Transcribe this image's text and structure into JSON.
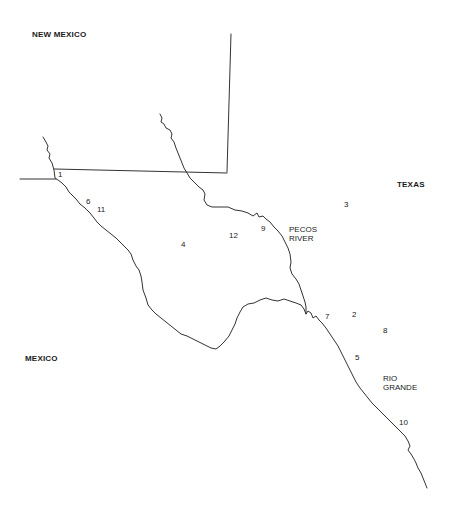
{
  "map": {
    "regions": {
      "new_mexico": "NEW MEXICO",
      "texas": "TEXAS",
      "mexico": "MEXICO"
    },
    "rivers": {
      "pecos": {
        "line1": "PECOS",
        "line2": "RIVER"
      },
      "rio_grande": {
        "line1": "RIO",
        "line2": "GRANDE"
      }
    },
    "sites": [
      {
        "id": "1",
        "label": "1"
      },
      {
        "id": "2",
        "label": "2"
      },
      {
        "id": "3",
        "label": "3"
      },
      {
        "id": "4",
        "label": "4"
      },
      {
        "id": "5",
        "label": "5"
      },
      {
        "id": "6",
        "label": "6"
      },
      {
        "id": "7",
        "label": "7"
      },
      {
        "id": "8",
        "label": "8"
      },
      {
        "id": "9",
        "label": "9"
      },
      {
        "id": "10",
        "label": "10"
      },
      {
        "id": "11",
        "label": "11"
      },
      {
        "id": "12",
        "label": "12"
      }
    ],
    "colors": {
      "line": "#333333",
      "background": "#ffffff"
    }
  }
}
